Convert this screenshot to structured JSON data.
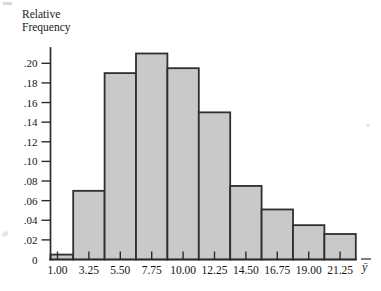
{
  "chart_data": {
    "type": "bar",
    "title": "",
    "subtitle": "",
    "ylabel": "Relative Frequency",
    "ylabel_lines": [
      "Relative",
      "Frequency"
    ],
    "xlabel": "ȳ",
    "grid": false,
    "legend": null,
    "ylim": [
      0,
      0.215
    ],
    "y_ticks": [
      0,
      0.02,
      0.04,
      0.06,
      0.08,
      0.1,
      0.12,
      0.14,
      0.16,
      0.18,
      0.2
    ],
    "y_tick_labels": [
      "0",
      ".02",
      ".04",
      ".06",
      ".08",
      ".10",
      ".12",
      ".14",
      ".16",
      ".18",
      ".20"
    ],
    "x_tick_labels": [
      "1.00",
      "3.25",
      "5.50",
      "7.75",
      "10.00",
      "12.25",
      "14.50",
      "16.75",
      "19.00",
      "21.25"
    ],
    "x_tick_values": [
      1.0,
      3.25,
      5.5,
      7.75,
      10.0,
      12.25,
      14.5,
      16.75,
      19.0,
      21.25
    ],
    "bin_width": 2.25,
    "categories": [
      "1.00",
      "3.25",
      "5.50",
      "7.75",
      "10.00",
      "12.25",
      "14.50",
      "16.75",
      "19.00",
      "21.25"
    ],
    "values": [
      0.005,
      0.07,
      0.19,
      0.21,
      0.195,
      0.15,
      0.075,
      0.051,
      0.035,
      0.026
    ],
    "bars": [
      {
        "center": "1.00",
        "value": 0.005
      },
      {
        "center": "3.25",
        "value": 0.07
      },
      {
        "center": "5.50",
        "value": 0.19
      },
      {
        "center": "7.75",
        "value": 0.21
      },
      {
        "center": "10.00",
        "value": 0.195
      },
      {
        "center": "12.25",
        "value": 0.15
      },
      {
        "center": "14.50",
        "value": 0.075
      },
      {
        "center": "16.75",
        "value": 0.051
      },
      {
        "center": "19.00",
        "value": 0.035
      },
      {
        "center": "21.25",
        "value": 0.026
      }
    ],
    "colors": {
      "bar_fill": "#c9c9c9",
      "bar_border": "#2f2f2f",
      "axis": "#2b2b2b",
      "text": "#141414",
      "background": "#ffffff"
    }
  }
}
